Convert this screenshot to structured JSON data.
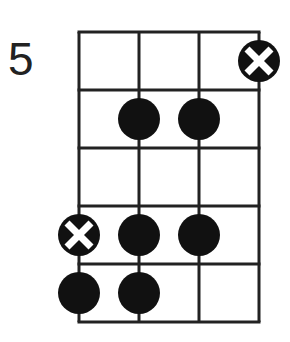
{
  "diagram": {
    "type": "fretboard-chord-diagram",
    "starting_fret_label": "5",
    "strings": 4,
    "frets": 5,
    "line_color": "#222222",
    "dot_color": "#111111",
    "markers": [
      {
        "fret": 1,
        "string": 4,
        "kind": "x-root"
      },
      {
        "fret": 2,
        "string": 2,
        "kind": "dot"
      },
      {
        "fret": 2,
        "string": 3,
        "kind": "dot"
      },
      {
        "fret": 4,
        "string": 1,
        "kind": "x-root"
      },
      {
        "fret": 4,
        "string": 2,
        "kind": "dot"
      },
      {
        "fret": 4,
        "string": 3,
        "kind": "dot"
      },
      {
        "fret": 5,
        "string": 1,
        "kind": "dot"
      },
      {
        "fret": 5,
        "string": 2,
        "kind": "dot"
      }
    ]
  }
}
